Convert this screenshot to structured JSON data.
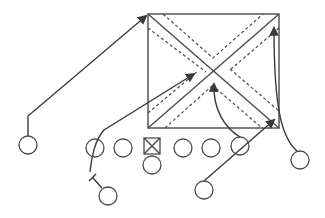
{
  "diagram": {
    "type": "football-play-diagram",
    "colors": {
      "line": "#4a4a4a",
      "route": "#3a3a3a",
      "background": "#ffffff"
    },
    "zone_box": {
      "x": 148,
      "y": 14,
      "width": 131,
      "height": 114
    },
    "center": {
      "shape": "square-with-x",
      "x": 152,
      "y": 146,
      "size": 16
    },
    "offense_players": [
      {
        "id": "left-receiver",
        "x": 28,
        "y": 145,
        "r": 9
      },
      {
        "id": "lineman-1",
        "x": 95,
        "y": 148,
        "r": 9
      },
      {
        "id": "lineman-2",
        "x": 123,
        "y": 148,
        "r": 9
      },
      {
        "id": "quarterback",
        "x": 152,
        "y": 165,
        "r": 9
      },
      {
        "id": "lineman-4",
        "x": 183,
        "y": 148,
        "r": 9
      },
      {
        "id": "lineman-5",
        "x": 211,
        "y": 148,
        "r": 9
      },
      {
        "id": "tight-end",
        "x": 240,
        "y": 146,
        "r": 9
      },
      {
        "id": "right-receiver",
        "x": 300,
        "y": 160,
        "r": 9
      },
      {
        "id": "back-left",
        "x": 108,
        "y": 196,
        "r": 9
      },
      {
        "id": "back-right",
        "x": 204,
        "y": 190,
        "r": 9
      }
    ]
  }
}
